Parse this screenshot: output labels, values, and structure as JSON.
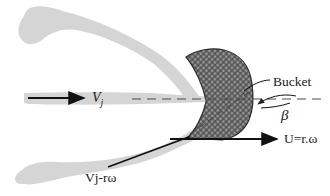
{
  "diagram": {
    "labels": {
      "jet_velocity": {
        "main": "V",
        "sub": "j"
      },
      "bucket": "Bucket",
      "deflection_angle": "β",
      "bucket_speed": "U=r.ω",
      "relative_velocity": "Vj-rω"
    },
    "colors": {
      "background": "#ffffff",
      "stream_gray": "#d5d5d5",
      "bucket_base": "#979797",
      "hatch_line": "#3f3f3f",
      "bucket_outline": "#2e2e2e",
      "dash_line": "#4a4a4a",
      "ink": "#111111"
    }
  }
}
